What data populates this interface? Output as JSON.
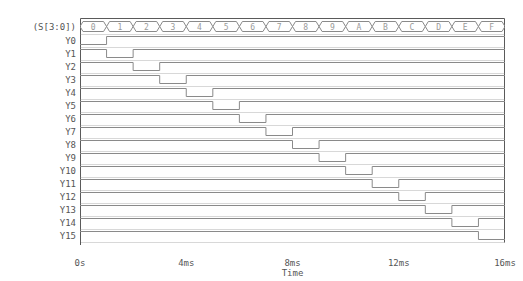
{
  "chart_data": {
    "type": "line",
    "title": "",
    "subtitle": "",
    "xlabel": "Time",
    "ylabel": "",
    "grid": false,
    "legend": "none",
    "xlim": [
      0,
      16
    ],
    "x_unit": "ms",
    "x_tick_values": [
      0,
      4,
      8,
      12,
      16
    ],
    "x_tick_labels": [
      "0s",
      "4ms",
      "8ms",
      "12ms",
      "16ms"
    ],
    "bus": {
      "name": "(S[3:0])",
      "radix": "hex",
      "segment_duration_ms": 1,
      "segments": [
        {
          "label": "0",
          "t_start": 0,
          "t_end": 1
        },
        {
          "label": "1",
          "t_start": 1,
          "t_end": 2
        },
        {
          "label": "2",
          "t_start": 2,
          "t_end": 3
        },
        {
          "label": "3",
          "t_start": 3,
          "t_end": 4
        },
        {
          "label": "4",
          "t_start": 4,
          "t_end": 5
        },
        {
          "label": "5",
          "t_start": 5,
          "t_end": 6
        },
        {
          "label": "6",
          "t_start": 6,
          "t_end": 7
        },
        {
          "label": "7",
          "t_start": 7,
          "t_end": 8
        },
        {
          "label": "8",
          "t_start": 8,
          "t_end": 9
        },
        {
          "label": "9",
          "t_start": 9,
          "t_end": 10
        },
        {
          "label": "A",
          "t_start": 10,
          "t_end": 11
        },
        {
          "label": "B",
          "t_start": 11,
          "t_end": 12
        },
        {
          "label": "C",
          "t_start": 12,
          "t_end": 13
        },
        {
          "label": "D",
          "t_start": 13,
          "t_end": 14
        },
        {
          "label": "E",
          "t_start": 14,
          "t_end": 15
        },
        {
          "label": "F",
          "t_start": 15,
          "t_end": 16
        }
      ]
    },
    "signals": [
      {
        "name": "Y0",
        "idle_level": 1,
        "low_t_start": 0,
        "low_t_end": 1
      },
      {
        "name": "Y1",
        "idle_level": 1,
        "low_t_start": 1,
        "low_t_end": 2
      },
      {
        "name": "Y2",
        "idle_level": 1,
        "low_t_start": 2,
        "low_t_end": 3
      },
      {
        "name": "Y3",
        "idle_level": 1,
        "low_t_start": 3,
        "low_t_end": 4
      },
      {
        "name": "Y4",
        "idle_level": 1,
        "low_t_start": 4,
        "low_t_end": 5
      },
      {
        "name": "Y5",
        "idle_level": 1,
        "low_t_start": 5,
        "low_t_end": 6
      },
      {
        "name": "Y6",
        "idle_level": 1,
        "low_t_start": 6,
        "low_t_end": 7
      },
      {
        "name": "Y7",
        "idle_level": 1,
        "low_t_start": 7,
        "low_t_end": 8
      },
      {
        "name": "Y8",
        "idle_level": 1,
        "low_t_start": 8,
        "low_t_end": 9
      },
      {
        "name": "Y9",
        "idle_level": 1,
        "low_t_start": 9,
        "low_t_end": 10
      },
      {
        "name": "Y10",
        "idle_level": 1,
        "low_t_start": 10,
        "low_t_end": 11
      },
      {
        "name": "Y11",
        "idle_level": 1,
        "low_t_start": 11,
        "low_t_end": 12
      },
      {
        "name": "Y12",
        "idle_level": 1,
        "low_t_start": 12,
        "low_t_end": 13
      },
      {
        "name": "Y13",
        "idle_level": 1,
        "low_t_start": 13,
        "low_t_end": 14
      },
      {
        "name": "Y14",
        "idle_level": 1,
        "low_t_start": 14,
        "low_t_end": 15
      },
      {
        "name": "Y15",
        "idle_level": 1,
        "low_t_start": 15,
        "low_t_end": 16
      }
    ]
  },
  "colors": {
    "background": "#ffffff",
    "trace": "#8a8a8a",
    "border": "#5a5a5a",
    "axis": "#555555",
    "text": "#555555",
    "bus_text": "#9a9a9a",
    "tick": "#777777"
  }
}
